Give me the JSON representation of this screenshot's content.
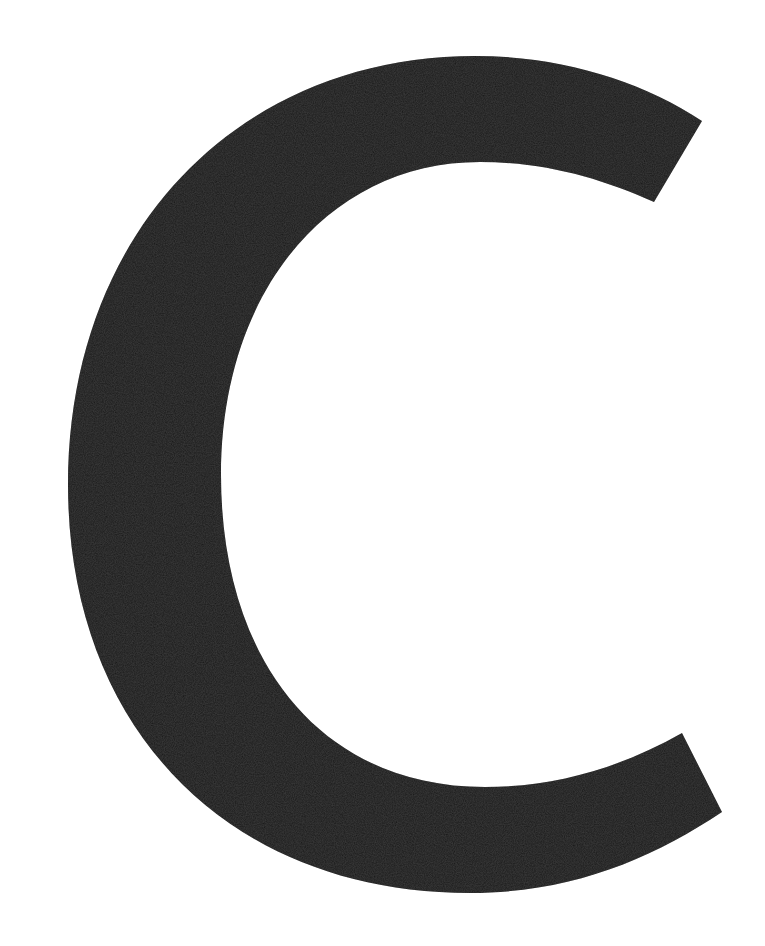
{
  "image": {
    "background_color": "#ffffff",
    "glyph": {
      "character": "C",
      "fill_color": "#1a1a1a",
      "style": "large black sans-serif capital letter"
    }
  }
}
